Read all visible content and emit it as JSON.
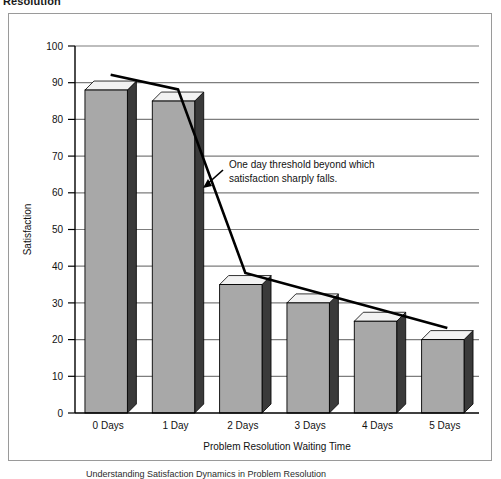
{
  "figure": {
    "title": "Resolution",
    "caption": "Understanding Satisfaction Dynamics in Problem Resolution"
  },
  "colors": {
    "bar_face": "#a8a8a8",
    "bar_side": "#3a3a3a",
    "bar_top": "#f2f2f2",
    "bar_outline": "#000000",
    "grid": "#7d7d7d",
    "axis": "#000000",
    "trend_line": "#000000",
    "frame": "#9a9a9a",
    "background": "#ffffff"
  },
  "annotation": {
    "line1": "One day threshold beyond which",
    "line2": "satisfaction sharply falls.",
    "arrow_name": "annotation-arrow"
  },
  "chart_data": {
    "type": "bar",
    "title": "",
    "xlabel": "Problem Resolution Waiting Time",
    "ylabel": "Satisfaction",
    "categories": [
      "0 Days",
      "1 Day",
      "2 Days",
      "3 Days",
      "4 Days",
      "5 Days"
    ],
    "values": [
      88,
      85,
      35,
      30,
      25,
      20
    ],
    "ylim": [
      0,
      100
    ],
    "ytick_step": 10,
    "yticks": [
      0,
      10,
      20,
      30,
      40,
      50,
      60,
      70,
      80,
      90,
      100
    ],
    "ytick_labels": [
      "0",
      "10",
      "20",
      "30",
      "40",
      "50",
      "60",
      "70",
      "80",
      "90",
      "100"
    ],
    "grid": true,
    "legend": false,
    "style": "3d-column",
    "series": [
      {
        "name": "Satisfaction",
        "type": "bar",
        "values": [
          88,
          85,
          35,
          30,
          25,
          20
        ]
      },
      {
        "name": "Trend",
        "type": "line",
        "values": [
          90,
          86,
          36,
          31,
          26,
          21
        ]
      }
    ]
  }
}
